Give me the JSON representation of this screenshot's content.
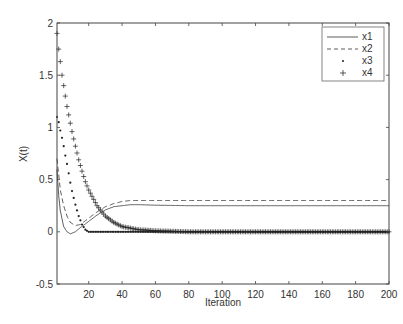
{
  "chart_data": {
    "type": "line",
    "title": "",
    "xlabel": "Iteration",
    "ylabel": "X(t)",
    "xlim": [
      1,
      200
    ],
    "ylim": [
      -0.5,
      2
    ],
    "xticks": [
      20,
      40,
      60,
      80,
      100,
      120,
      140,
      160,
      180,
      200
    ],
    "yticks": [
      -0.5,
      0,
      0.5,
      1,
      1.5,
      2
    ],
    "ytick_labels": [
      "-0.5",
      "0",
      "0.5",
      "1",
      "1.5",
      "2"
    ],
    "grid": false,
    "legend_position": "upper right",
    "series": [
      {
        "name": "x1",
        "style": "solid",
        "x": [
          1,
          2,
          3,
          5,
          7,
          9,
          12,
          15,
          20,
          25,
          30,
          35,
          40,
          45,
          50,
          60,
          80,
          100,
          150,
          200
        ],
        "values": [
          0.6,
          0.35,
          0.2,
          0.05,
          0.0,
          -0.02,
          0.0,
          0.04,
          0.1,
          0.16,
          0.21,
          0.24,
          0.25,
          0.26,
          0.26,
          0.255,
          0.25,
          0.25,
          0.25,
          0.25
        ]
      },
      {
        "name": "x2",
        "style": "dashed",
        "x": [
          1,
          2,
          3,
          5,
          7,
          9,
          12,
          15,
          20,
          25,
          30,
          35,
          40,
          45,
          50,
          60,
          80,
          100,
          150,
          200
        ],
        "values": [
          0.7,
          0.55,
          0.4,
          0.25,
          0.15,
          0.09,
          0.06,
          0.07,
          0.13,
          0.19,
          0.24,
          0.27,
          0.29,
          0.3,
          0.3,
          0.3,
          0.3,
          0.3,
          0.3,
          0.3
        ]
      },
      {
        "name": "x3",
        "style": "dot-markers",
        "x": [
          1,
          2,
          3,
          4,
          5,
          6,
          7,
          8,
          9,
          10,
          12,
          14,
          16,
          18,
          20,
          25,
          30,
          40,
          60,
          100,
          150,
          200
        ],
        "values": [
          1.1,
          1.05,
          0.97,
          0.9,
          0.82,
          0.73,
          0.65,
          0.56,
          0.47,
          0.39,
          0.26,
          0.15,
          0.07,
          0.02,
          0.0,
          0.0,
          0.0,
          0.0,
          0.0,
          0.0,
          0.0,
          0.0
        ]
      },
      {
        "name": "x4",
        "style": "plus-markers",
        "x": [
          1,
          2,
          3,
          4,
          5,
          6,
          7,
          8,
          9,
          10,
          12,
          14,
          16,
          18,
          20,
          25,
          30,
          35,
          40,
          50,
          60,
          80,
          100,
          150,
          200
        ],
        "values": [
          1.9,
          1.75,
          1.63,
          1.5,
          1.4,
          1.3,
          1.2,
          1.12,
          1.04,
          0.96,
          0.82,
          0.69,
          0.58,
          0.48,
          0.4,
          0.25,
          0.15,
          0.09,
          0.05,
          0.02,
          0.01,
          0.0,
          0.0,
          0.0,
          0.0
        ]
      }
    ]
  },
  "legend": {
    "items": [
      {
        "label": "x1"
      },
      {
        "label": "x2"
      },
      {
        "label": "x3"
      },
      {
        "label": "x4"
      }
    ]
  },
  "axes": {
    "xlabel": "Iteration",
    "ylabel": "X(t)"
  }
}
